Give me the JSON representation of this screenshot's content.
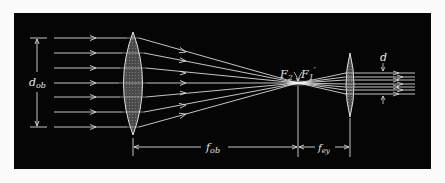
{
  "figure": {
    "background": "#050505",
    "line_color": "#d9d9d9",
    "lens_fill": "#5a5a5a"
  },
  "labels": {
    "objective_diameter": "d",
    "objective_diameter_sub": "ob",
    "objective_focal": "f",
    "objective_focal_sub": "ob",
    "eyepiece_focal": "f",
    "eyepiece_focal_sub": "ey",
    "focal_point_left": "F",
    "focal_point_left_sub": "2",
    "focal_point_right": "F",
    "focal_point_right_sub": "1",
    "focal_point_right_prime": "′",
    "exit_beam_diameter": "d"
  },
  "geometry": {
    "panel": {
      "x": 14,
      "y": 13,
      "w": 417,
      "h": 156
    },
    "objective": {
      "cx": 133,
      "top": 32,
      "bottom": 135,
      "half_width": 14
    },
    "eyepiece": {
      "cx": 350,
      "top": 53,
      "bottom": 117,
      "half_width": 6
    },
    "focus": {
      "x": 298,
      "y": 83
    },
    "input_ray_start_x": 54,
    "input_rays_y": [
      38,
      53,
      68,
      83,
      97,
      112,
      127
    ],
    "output_rays_y": [
      73,
      77,
      80,
      84,
      87,
      90,
      94
    ],
    "output_ray_end_x": 415
  }
}
